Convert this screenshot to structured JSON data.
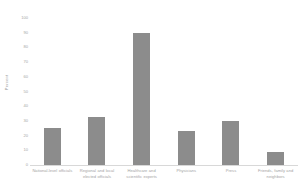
{
  "chart_data": {
    "type": "bar",
    "title": "",
    "xlabel": "",
    "ylabel": "Percent",
    "ylim": [
      0,
      100
    ],
    "ytick_step": 10,
    "grid": false,
    "legend": "none",
    "bar_color": "#8c8c8c",
    "background_color": "#ffffff",
    "text_color": "#a4a4a4",
    "yticks": [
      "100",
      "90",
      "80",
      "70",
      "60",
      "50",
      "40",
      "30",
      "20",
      "10",
      "0"
    ],
    "categories": [
      "National-level officials",
      "Regional and local elected officials",
      "Healthcare and scientific experts",
      "Physicians",
      "Press",
      "Friends, family and neighbors"
    ],
    "values": [
      25,
      33,
      90,
      23,
      30,
      9
    ]
  }
}
